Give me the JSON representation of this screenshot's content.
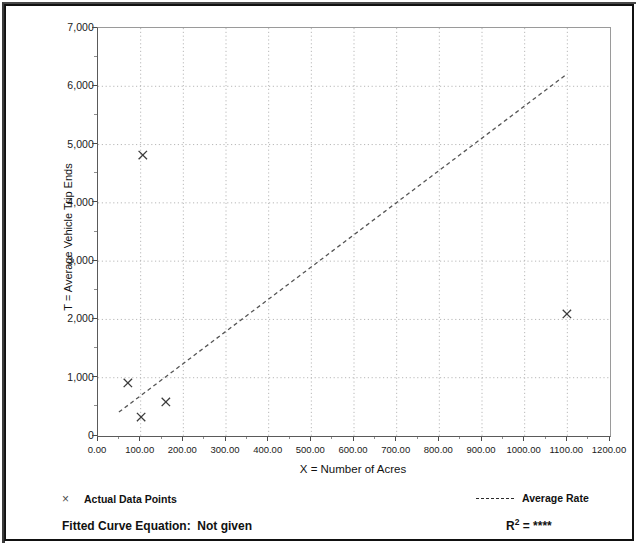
{
  "chart_data": {
    "type": "scatter",
    "title": "",
    "xlabel": "X = Number of Acres",
    "ylabel": "T = Average Vehicle Trip Ends",
    "xlim": [
      0,
      1200
    ],
    "ylim": [
      0,
      7000
    ],
    "grid": true,
    "x_ticks": [
      "0.00",
      "100.00",
      "200.00",
      "300.00",
      "400.00",
      "500.00",
      "600.00",
      "700.00",
      "800.00",
      "900.00",
      "1000.00",
      "1100.00",
      "1200.00"
    ],
    "x_tick_values": [
      0,
      100,
      200,
      300,
      400,
      500,
      600,
      700,
      800,
      900,
      1000,
      1100,
      1200
    ],
    "y_ticks": [
      "0",
      "1,000",
      "2,000",
      "3,000",
      "4,000",
      "5,000",
      "6,000",
      "7,000"
    ],
    "y_tick_values": [
      0,
      1000,
      2000,
      3000,
      4000,
      5000,
      6000,
      7000
    ],
    "y_minor_step": 500,
    "series": [
      {
        "name": "Actual Data Points",
        "type": "scatter",
        "marker": "x",
        "points": [
          {
            "x": 70,
            "y": 910
          },
          {
            "x": 101,
            "y": 325
          },
          {
            "x": 105,
            "y": 4820
          },
          {
            "x": 159,
            "y": 585
          },
          {
            "x": 1099,
            "y": 2095
          }
        ]
      },
      {
        "name": "Average Rate",
        "type": "line",
        "style": "dashed",
        "points": [
          {
            "x": 49,
            "y": 410
          },
          {
            "x": 1099,
            "y": 6210
          }
        ]
      }
    ]
  },
  "legend": {
    "data_points_marker": "×",
    "data_points_label": "Actual Data Points",
    "average_rate_label": "Average Rate"
  },
  "footer": {
    "fitted_curve_label": "Fitted Curve Equation:",
    "fitted_curve_value": "Not given",
    "r2_prefix": "R",
    "r2_exponent": "2",
    "r2_equals": "=",
    "r2_value": "****"
  },
  "ghost": {
    "line_1": "",
    "line_2": ""
  },
  "colors": {
    "axis": "#4a4a4a",
    "grid": "#b8b8b8",
    "marker": "#3a3a3a",
    "trend_line": "#555555",
    "text": "#111111",
    "frame": "#111111"
  }
}
